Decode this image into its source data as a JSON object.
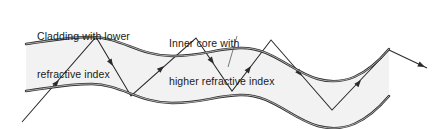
{
  "figure": {
    "background_color": "#ffffff",
    "width": 441,
    "height": 129
  },
  "labels": {
    "cladding": {
      "line1": "Cladding with lower",
      "line2": "refractive index"
    },
    "core": {
      "line1": "Inner core with",
      "line2": "higher refractive index"
    }
  },
  "colors": {
    "boundary_dark": "#2b2b2b",
    "boundary_light": "#8f8f8f",
    "core_fill": "#f2f2f2",
    "ray": "#2b2b2b",
    "leader": "#5a5a5a",
    "text": "#1a1a1a"
  },
  "diagram": {
    "core_top_path": "M 26,44 C 50,41 66,37 92,37 C 120,37 140,56 172,56 C 205,56 212,49 240,48 C 272,47 290,71 318,79 C 344,86 366,76 389,49",
    "core_bottom_path": "M 26,91 C 50,88 66,84 92,84 C 120,84 140,103 172,103 C 205,103 212,96 240,95 C 272,94 290,118 318,126 C 344,133 366,123 389,96",
    "ray_points": "22,122 96,37 131,96 196,38 232,91 271,40 332,110 389,50",
    "exit_ray": "389,50 427,68",
    "ray_arrowheads": [
      {
        "x": 59,
        "y": 80,
        "angle": -49
      },
      {
        "x": 113,
        "y": 66,
        "angle": 59
      },
      {
        "x": 164,
        "y": 66,
        "angle": -42
      },
      {
        "x": 214,
        "y": 64,
        "angle": 54
      },
      {
        "x": 251,
        "y": 66,
        "angle": -54
      },
      {
        "x": 302,
        "y": 76,
        "angle": 49
      },
      {
        "x": 361,
        "y": 80,
        "angle": -50
      },
      {
        "x": 425,
        "y": 67,
        "angle": 25
      }
    ],
    "leader_line": "237,36 228,67"
  }
}
